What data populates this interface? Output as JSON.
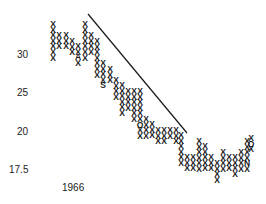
{
  "chart_data": {
    "type": "point-and-figure",
    "title": "",
    "xlabel": "",
    "ylabel": "",
    "y_ticks": [
      {
        "label": "30",
        "value": 30,
        "y": 55
      },
      {
        "label": "25",
        "value": 25,
        "y": 93
      },
      {
        "label": "20",
        "value": 20,
        "y": 132
      },
      {
        "label": "17.5",
        "value": 17.5,
        "y": 170
      }
    ],
    "x_ticks": [
      {
        "label": "1966",
        "x": 75,
        "y": 188
      }
    ],
    "trendline": {
      "x1": 88,
      "y1": 14,
      "x2": 187,
      "y2": 133,
      "description": "downtrend line"
    },
    "cell": {
      "w": 6,
      "h": 5.6
    },
    "columns": [
      {
        "x": 53,
        "marks": [
          "X",
          "X",
          "X",
          "X",
          "X",
          "X",
          "X"
        ],
        "top": 24
      },
      {
        "x": 59,
        "marks": [
          "X",
          "X",
          "X"
        ],
        "top": 35
      },
      {
        "x": 66,
        "marks": [
          "X",
          "X",
          "X"
        ],
        "top": 35
      },
      {
        "x": 72,
        "marks": [
          "X",
          "X",
          "X"
        ],
        "top": 41
      },
      {
        "x": 78,
        "marks": [
          "X",
          "X",
          "A",
          "X"
        ],
        "top": 46
      },
      {
        "x": 85,
        "marks": [
          "X",
          "X",
          "X",
          "X",
          "X",
          "X",
          "X"
        ],
        "top": 24
      },
      {
        "x": 91,
        "marks": [
          "X",
          "X",
          "X",
          "X"
        ],
        "top": 35
      },
      {
        "x": 97,
        "marks": [
          "X",
          "X",
          "X",
          "X",
          "X",
          "X",
          "X"
        ],
        "top": 41
      },
      {
        "x": 103,
        "marks": [
          "X",
          "X",
          "X",
          "X",
          "S"
        ],
        "top": 63
      },
      {
        "x": 110,
        "marks": [
          "X",
          "X",
          "X"
        ],
        "top": 69
      },
      {
        "x": 116,
        "marks": [
          "X",
          "X",
          "X",
          "X"
        ],
        "top": 80
      },
      {
        "x": 122,
        "marks": [
          "X",
          "X",
          "X",
          "X",
          "X",
          "X"
        ],
        "top": 85
      },
      {
        "x": 128,
        "marks": [
          "X",
          "X",
          "X",
          "X"
        ],
        "top": 91
      },
      {
        "x": 134,
        "marks": [
          "X",
          "X",
          "X",
          "X",
          "X",
          "X"
        ],
        "top": 91
      },
      {
        "x": 140,
        "marks": [
          "X",
          "X",
          "X",
          "X",
          "X",
          "X",
          "O",
          "X",
          "X"
        ],
        "top": 91
      },
      {
        "x": 146,
        "marks": [
          "X",
          "X",
          "X",
          "X"
        ],
        "top": 119
      },
      {
        "x": 152,
        "marks": [
          "X",
          "X",
          "X"
        ],
        "top": 124
      },
      {
        "x": 158,
        "marks": [
          "X",
          "X",
          "X"
        ],
        "top": 130
      },
      {
        "x": 164,
        "marks": [
          "X",
          "X",
          "X"
        ],
        "top": 130
      },
      {
        "x": 170,
        "marks": [
          "X",
          "X"
        ],
        "top": 130
      },
      {
        "x": 176,
        "marks": [
          "X",
          "X",
          "X"
        ],
        "top": 130
      },
      {
        "x": 181,
        "marks": [
          "X",
          "X",
          "X",
          "X",
          "X",
          "X"
        ],
        "top": 135
      },
      {
        "x": 187,
        "marks": [
          "X",
          "X",
          "X"
        ],
        "top": 157
      },
      {
        "x": 193,
        "marks": [
          "X",
          "X",
          "X"
        ],
        "top": 157
      },
      {
        "x": 199,
        "marks": [
          "X",
          "X",
          "X",
          "X",
          "X",
          "X"
        ],
        "top": 141
      },
      {
        "x": 205,
        "marks": [
          "X",
          "X",
          "X",
          "X",
          "X"
        ],
        "top": 146
      },
      {
        "x": 211,
        "marks": [
          "X",
          "X",
          "X"
        ],
        "top": 157
      },
      {
        "x": 217,
        "marks": [
          "X",
          "X",
          "X",
          "X"
        ],
        "top": 163
      },
      {
        "x": 223,
        "marks": [
          "X",
          "X",
          "X",
          "X"
        ],
        "top": 152
      },
      {
        "x": 229,
        "marks": [
          "X",
          "X",
          "X"
        ],
        "top": 157
      },
      {
        "x": 235,
        "marks": [
          "X",
          "X",
          "X",
          "X"
        ],
        "top": 157
      },
      {
        "x": 241,
        "marks": [
          "X",
          "X",
          "X",
          "X"
        ],
        "top": 152
      },
      {
        "x": 247,
        "marks": [
          "X",
          "X",
          "X",
          "X",
          "N",
          "X"
        ],
        "top": 141
      },
      {
        "x": 251,
        "marks": [
          "X",
          "O",
          "X"
        ],
        "top": 138
      }
    ],
    "ylim": [
      17.5,
      33
    ],
    "grid": false,
    "legend": null
  }
}
